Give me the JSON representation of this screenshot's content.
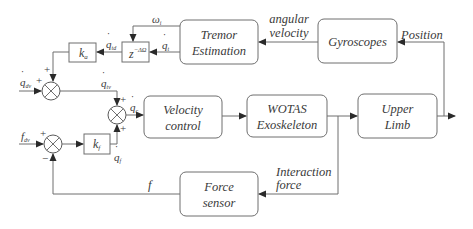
{
  "blocks": {
    "tremor_estimation": {
      "line1": "Tremor",
      "line2": "Estimation"
    },
    "gyroscopes": {
      "label": "Gyroscopes"
    },
    "velocity_control": {
      "line1": "Velocity",
      "line2": "control"
    },
    "wotas": {
      "line1": "WOTAS",
      "line2": "Exoskeleton"
    },
    "upper_limb": {
      "line1": "Upper",
      "line2": "Limb"
    },
    "force_sensor": {
      "line1": "Force",
      "line2": "sensor"
    },
    "delay": {
      "base": "z",
      "exp": "−ΔΩ"
    },
    "gain_a": {
      "base": "k",
      "sub": "a"
    },
    "gain_f": {
      "base": "k",
      "sub": "f"
    }
  },
  "signals": {
    "angular_velocity": {
      "line1": "angular",
      "line2": "velocity"
    },
    "position": "Position",
    "interaction_force": {
      "line1": "Interaction",
      "line2": "force"
    },
    "omega": {
      "base": "ω",
      "sub": "i"
    },
    "q_t": {
      "base": "q",
      "sub": "t",
      "dot": "˙"
    },
    "q_td": {
      "base": "q",
      "sub": "td",
      "dot": "˙"
    },
    "q_dv": {
      "base": "q",
      "sub": "dv",
      "dot": "˙"
    },
    "q_tv": {
      "base": "q",
      "sub": "tv",
      "dot": "˙"
    },
    "q_c": {
      "base": "q",
      "sub": "c",
      "dot": "˙"
    },
    "q_f": {
      "base": "q",
      "sub": "f",
      "dot": "˙"
    },
    "f_dv": {
      "base": "f",
      "sub": "dv"
    },
    "f": "f"
  },
  "summing_junctions": {
    "sum1": {
      "top": "+",
      "left": "+"
    },
    "sum2": {
      "top": "+",
      "bottom": "+"
    },
    "sum3": {
      "left": "+",
      "bottom": "−"
    }
  }
}
